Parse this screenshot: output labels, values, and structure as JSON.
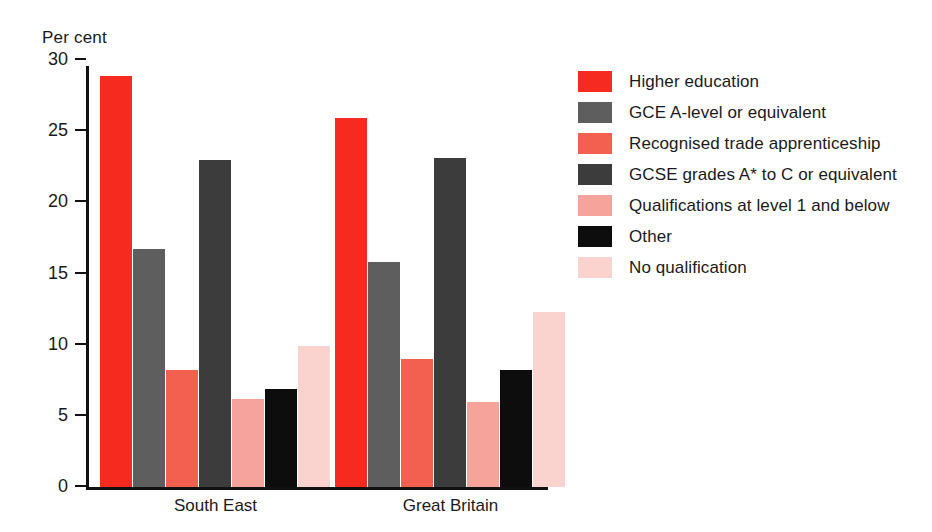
{
  "chart_data": {
    "type": "bar",
    "title": "",
    "ylabel": "Per cent",
    "xlabel": "",
    "ylim": [
      0,
      30
    ],
    "yticks": [
      0,
      5,
      10,
      15,
      20,
      25,
      30
    ],
    "grid": false,
    "legend_position": "right",
    "categories": [
      "South East",
      "Great Britain"
    ],
    "series": [
      {
        "name": "Higher education",
        "color": "#f62a1e",
        "values": [
          28.9,
          25.9
        ]
      },
      {
        "name": "GCE A-level or equivalent",
        "color": "#5e5e5e",
        "values": [
          16.7,
          15.8
        ]
      },
      {
        "name": "Recognised trade apprenticeship",
        "color": "#f4604f",
        "values": [
          8.2,
          9.0
        ]
      },
      {
        "name": "GCSE grades A* to C or equivalent",
        "color": "#3c3c3c",
        "values": [
          23.0,
          23.1
        ]
      },
      {
        "name": "Qualifications at level 1 and below",
        "color": "#f6a49b",
        "values": [
          6.2,
          6.0
        ]
      },
      {
        "name": "Other",
        "color": "#0d0d0d",
        "values": [
          6.9,
          8.2
        ]
      },
      {
        "name": "No qualification",
        "color": "#fad3cf",
        "values": [
          9.9,
          12.3
        ]
      }
    ]
  },
  "axis": {
    "y_title": "Per cent",
    "tick_labels": [
      "0",
      "5",
      "10",
      "15",
      "20",
      "25",
      "30"
    ],
    "category_labels": [
      "South East",
      "Great Britain"
    ]
  },
  "legend": {
    "items": [
      {
        "label": "Higher education",
        "color": "#f62a1e"
      },
      {
        "label": "GCE A-level or equivalent",
        "color": "#5e5e5e"
      },
      {
        "label": "Recognised trade apprenticeship",
        "color": "#f4604f"
      },
      {
        "label": "GCSE grades A* to C or equivalent",
        "color": "#3c3c3c"
      },
      {
        "label": "Qualifications at level 1 and below",
        "color": "#f6a49b"
      },
      {
        "label": "Other",
        "color": "#0d0d0d"
      },
      {
        "label": "No qualification",
        "color": "#fad3cf"
      }
    ]
  }
}
